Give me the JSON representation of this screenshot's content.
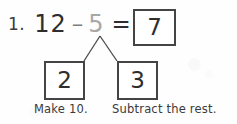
{
  "problem": {
    "item_number": "1.",
    "minuend": "12",
    "minus_sign": "–",
    "subtrahend": "5",
    "equals_sign": "=",
    "answer": "7"
  },
  "number_bond": {
    "part_left": "2",
    "part_right": "3"
  },
  "captions": {
    "left": "Make 10.",
    "right": "Subtract the rest."
  },
  "colors": {
    "ink": "#2e2e2e",
    "faded_ink": "#a8a8a8",
    "operator": "#7d7d7d",
    "box_border": "#444444",
    "page": "#fefefe"
  }
}
